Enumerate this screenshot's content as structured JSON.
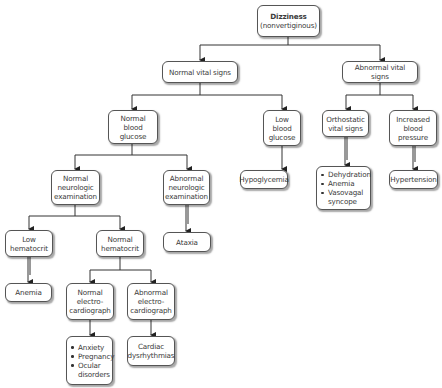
{
  "diagram": {
    "type": "decision-flowchart",
    "root": {
      "title": "Dizziness",
      "subtitle": "(nonvertiginous)"
    },
    "nodes": {
      "normal_vital_signs": "Normal vital signs",
      "abnormal_vital_signs": "Abnormal vital signs",
      "normal_blood_glucose": "Normal blood glucose",
      "low_blood_glucose": "Low blood glucose",
      "orthostatic_vital_signs": "Orthostatic vital signs",
      "increased_blood_pressure": "Increased blood pressure",
      "normal_neurologic_examination": "Normal neurologic examination",
      "abnormal_neurologic_examination": "Abnormal neurologic examination",
      "hypoglycemia": "Hypoglycemia",
      "hypertension": "Hypertension",
      "low_hematocrit": "Low hematocrit",
      "normal_hematocrit": "Normal hematocrit",
      "ataxia": "Ataxia",
      "anemia": "Anemia",
      "normal_ecg": "Normal electro-cardiograph",
      "abnormal_ecg": "Abnormal electro-cardiograph",
      "cardiac_dysrhythmias": "Cardiac dysrhythmias"
    },
    "lists": {
      "orthostatic_causes": [
        "Dehydration",
        "Anemia",
        "Vasovagal syncope"
      ],
      "normal_ecg_causes": [
        "Anxiety",
        "Pregnancy",
        "Ocular disorders"
      ]
    },
    "edges": [
      [
        "Dizziness",
        "Normal vital signs"
      ],
      [
        "Dizziness",
        "Abnormal vital signs"
      ],
      [
        "Normal vital signs",
        "Normal blood glucose"
      ],
      [
        "Normal vital signs",
        "Low blood glucose"
      ],
      [
        "Abnormal vital signs",
        "Orthostatic vital signs"
      ],
      [
        "Abnormal vital signs",
        "Increased blood pressure"
      ],
      [
        "Normal blood glucose",
        "Normal neurologic examination"
      ],
      [
        "Normal blood glucose",
        "Abnormal neurologic examination"
      ],
      [
        "Low blood glucose",
        "Hypoglycemia"
      ],
      [
        "Orthostatic vital signs",
        "Dehydration / Anemia / Vasovagal syncope"
      ],
      [
        "Increased blood pressure",
        "Hypertension"
      ],
      [
        "Normal neurologic examination",
        "Low hematocrit"
      ],
      [
        "Normal neurologic examination",
        "Normal hematocrit"
      ],
      [
        "Abnormal neurologic examination",
        "Ataxia"
      ],
      [
        "Low hematocrit",
        "Anemia"
      ],
      [
        "Normal hematocrit",
        "Normal electro-cardiograph"
      ],
      [
        "Normal hematocrit",
        "Abnormal electro-cardiograph"
      ],
      [
        "Normal electro-cardiograph",
        "Anxiety / Pregnancy / Ocular disorders"
      ],
      [
        "Abnormal electro-cardiograph",
        "Cardiac dysrhythmias"
      ]
    ],
    "colors": {
      "line": "#333333",
      "box_border": "#555555",
      "box_fill": "#ffffff",
      "text": "#3a3a3a"
    }
  }
}
